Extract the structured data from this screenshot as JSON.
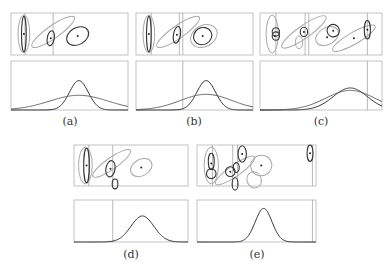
{
  "figure": {
    "panels": [
      {
        "id": "a",
        "caption": "(a)",
        "ellipses": [
          {
            "kind": "gray",
            "cx": 0.11,
            "cy": 0.5,
            "rx": 0.05,
            "ry": 0.45,
            "rot": 0
          },
          {
            "kind": "dark",
            "cx": 0.11,
            "cy": 0.5,
            "rx": 0.02,
            "ry": 0.42,
            "rot": 0
          },
          {
            "kind": "gray",
            "cx": 0.36,
            "cy": 0.45,
            "rx": 0.22,
            "ry": 0.15,
            "rot": -35
          },
          {
            "kind": "dark",
            "cx": 0.34,
            "cy": 0.6,
            "rx": 0.03,
            "ry": 0.18,
            "rot": 10
          },
          {
            "kind": "dark",
            "cx": 0.57,
            "cy": 0.55,
            "rx": 0.1,
            "ry": 0.2,
            "rot": -30
          }
        ],
        "dots": [
          [
            0.11,
            0.5
          ],
          [
            0.34,
            0.6
          ],
          [
            0.57,
            0.55
          ]
        ],
        "vlines_top": [
          0.12,
          0.36
        ],
        "vlines_bottom": [],
        "curves": [
          {
            "kind": "dark",
            "mu": 0.58,
            "sigma": 0.08,
            "amp": 0.6
          },
          {
            "kind": "gray",
            "mu": 0.58,
            "sigma": 0.25,
            "amp": 0.3
          }
        ]
      },
      {
        "id": "b",
        "caption": "(b)",
        "ellipses": [
          {
            "kind": "gray",
            "cx": 0.11,
            "cy": 0.5,
            "rx": 0.05,
            "ry": 0.45,
            "rot": 0
          },
          {
            "kind": "dark",
            "cx": 0.11,
            "cy": 0.5,
            "rx": 0.02,
            "ry": 0.42,
            "rot": 0
          },
          {
            "kind": "gray",
            "cx": 0.36,
            "cy": 0.45,
            "rx": 0.22,
            "ry": 0.15,
            "rot": -35
          },
          {
            "kind": "dark",
            "cx": 0.35,
            "cy": 0.52,
            "rx": 0.03,
            "ry": 0.2,
            "rot": 10
          },
          {
            "kind": "gray",
            "cx": 0.58,
            "cy": 0.55,
            "rx": 0.12,
            "ry": 0.25,
            "rot": -30
          },
          {
            "kind": "dark",
            "cx": 0.57,
            "cy": 0.55,
            "rx": 0.08,
            "ry": 0.2,
            "rot": -30
          }
        ],
        "dots": [
          [
            0.11,
            0.5
          ],
          [
            0.35,
            0.52
          ],
          [
            0.57,
            0.55
          ]
        ],
        "vlines_top": [
          0.13,
          0.37,
          0.4
        ],
        "vlines_bottom": [
          0.4
        ],
        "curves": [
          {
            "kind": "dark",
            "mu": 0.6,
            "sigma": 0.08,
            "amp": 0.6
          },
          {
            "kind": "gray",
            "mu": 0.6,
            "sigma": 0.22,
            "amp": 0.32
          }
        ]
      },
      {
        "id": "c",
        "caption": "(c)",
        "ellipses": [
          {
            "kind": "gray",
            "cx": 0.1,
            "cy": 0.5,
            "rx": 0.05,
            "ry": 0.45,
            "rot": 0
          },
          {
            "kind": "dark",
            "cx": 0.13,
            "cy": 0.55,
            "rx": 0.03,
            "ry": 0.1,
            "rot": 0
          },
          {
            "kind": "dark",
            "cx": 0.13,
            "cy": 0.45,
            "rx": 0.03,
            "ry": 0.1,
            "rot": 0
          },
          {
            "kind": "gray",
            "cx": 0.36,
            "cy": 0.45,
            "rx": 0.22,
            "ry": 0.15,
            "rot": -35
          },
          {
            "kind": "dark",
            "cx": 0.36,
            "cy": 0.45,
            "rx": 0.03,
            "ry": 0.11,
            "rot": 0
          },
          {
            "kind": "gray",
            "cx": 0.32,
            "cy": 0.7,
            "rx": 0.03,
            "ry": 0.15,
            "rot": 0
          },
          {
            "kind": "gray",
            "cx": 0.55,
            "cy": 0.55,
            "rx": 0.1,
            "ry": 0.2,
            "rot": -30
          },
          {
            "kind": "dark",
            "cx": 0.6,
            "cy": 0.42,
            "rx": 0.05,
            "ry": 0.15,
            "rot": -30
          },
          {
            "kind": "gray",
            "cx": 0.77,
            "cy": 0.6,
            "rx": 0.2,
            "ry": 0.14,
            "rot": -30
          },
          {
            "kind": "dark",
            "cx": 0.88,
            "cy": 0.4,
            "rx": 0.025,
            "ry": 0.22,
            "rot": 0
          }
        ],
        "dots": [
          [
            0.12,
            0.55
          ],
          [
            0.36,
            0.45
          ],
          [
            0.55,
            0.58
          ],
          [
            0.6,
            0.42
          ],
          [
            0.77,
            0.6
          ],
          [
            0.88,
            0.4
          ]
        ],
        "vlines_top": [
          0.13,
          0.37,
          0.4,
          0.88
        ],
        "vlines_bottom": [
          0.88
        ],
        "curves": [
          {
            "kind": "dark",
            "mu": 0.74,
            "sigma": 0.14,
            "amp": 0.45
          },
          {
            "kind": "gray",
            "mu": 0.74,
            "sigma": 0.2,
            "amp": 0.4
          }
        ]
      },
      {
        "id": "d",
        "caption": "(d)",
        "ellipses": [
          {
            "kind": "gray",
            "cx": 0.1,
            "cy": 0.5,
            "rx": 0.06,
            "ry": 0.45,
            "rot": 0
          },
          {
            "kind": "dark",
            "cx": 0.11,
            "cy": 0.5,
            "rx": 0.025,
            "ry": 0.42,
            "rot": 0
          },
          {
            "kind": "gray",
            "cx": 0.33,
            "cy": 0.45,
            "rx": 0.2,
            "ry": 0.14,
            "rot": -35
          },
          {
            "kind": "dark",
            "cx": 0.32,
            "cy": 0.58,
            "rx": 0.04,
            "ry": 0.2,
            "rot": 10
          },
          {
            "kind": "gray",
            "cx": 0.59,
            "cy": 0.55,
            "rx": 0.1,
            "ry": 0.2,
            "rot": -30
          },
          {
            "kind": "dark",
            "cx": 0.36,
            "cy": 0.95,
            "rx": 0.025,
            "ry": 0.12,
            "rot": 0
          }
        ],
        "dots": [
          [
            0.11,
            0.5
          ],
          [
            0.32,
            0.58
          ],
          [
            0.59,
            0.55
          ]
        ],
        "vlines_top": [
          0.13,
          0.34
        ],
        "vlines_bottom": [
          0.34
        ],
        "curves": [
          {
            "kind": "dark",
            "mu": 0.6,
            "sigma": 0.1,
            "amp": 0.62
          }
        ]
      },
      {
        "id": "e",
        "caption": "(e)",
        "ellipses": [
          {
            "kind": "gray",
            "cx": 0.12,
            "cy": 0.5,
            "rx": 0.06,
            "ry": 0.45,
            "rot": 0
          },
          {
            "kind": "dark",
            "cx": 0.12,
            "cy": 0.4,
            "rx": 0.025,
            "ry": 0.2,
            "rot": 0
          },
          {
            "kind": "dark",
            "cx": 0.12,
            "cy": 0.7,
            "rx": 0.04,
            "ry": 0.12,
            "rot": 0
          },
          {
            "kind": "gray",
            "cx": 0.32,
            "cy": 0.62,
            "rx": 0.2,
            "ry": 0.14,
            "rot": -35
          },
          {
            "kind": "dark",
            "cx": 0.28,
            "cy": 0.65,
            "rx": 0.04,
            "ry": 0.12,
            "rot": 0
          },
          {
            "kind": "dark",
            "cx": 0.33,
            "cy": 0.55,
            "rx": 0.025,
            "ry": 0.12,
            "rot": 0
          },
          {
            "kind": "dark",
            "cx": 0.38,
            "cy": 0.22,
            "rx": 0.035,
            "ry": 0.2,
            "rot": 0
          },
          {
            "kind": "gray",
            "cx": 0.54,
            "cy": 0.5,
            "rx": 0.09,
            "ry": 0.25,
            "rot": -25
          },
          {
            "kind": "gray",
            "cx": 0.48,
            "cy": 0.85,
            "rx": 0.06,
            "ry": 0.2,
            "rot": -20
          },
          {
            "kind": "dark",
            "cx": 0.32,
            "cy": 0.95,
            "rx": 0.025,
            "ry": 0.15,
            "rot": 0
          },
          {
            "kind": "dark",
            "cx": 0.95,
            "cy": 0.2,
            "rx": 0.025,
            "ry": 0.2,
            "rot": 0
          }
        ],
        "dots": [
          [
            0.12,
            0.45
          ],
          [
            0.28,
            0.65
          ],
          [
            0.38,
            0.22
          ],
          [
            0.54,
            0.5
          ],
          [
            0.95,
            0.2
          ]
        ],
        "vlines_top": [
          0.13,
          0.3,
          0.34,
          0.97
        ],
        "vlines_bottom": [
          0.97
        ],
        "curves": [
          {
            "kind": "dark",
            "mu": 0.56,
            "sigma": 0.07,
            "amp": 0.8
          }
        ]
      }
    ]
  }
}
